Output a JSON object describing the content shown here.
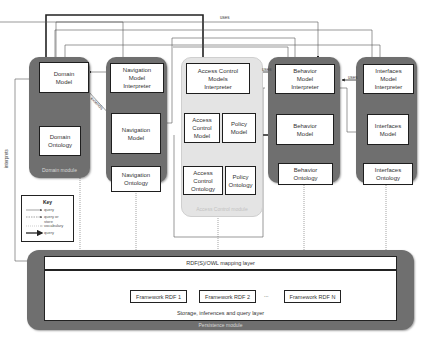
{
  "modules": {
    "domain": {
      "label": "Domain module",
      "boxes": {
        "model": "Domain\nModel",
        "ontology": "Domain\nOntology"
      }
    },
    "navigation": {
      "label": "Navigation module",
      "boxes": {
        "interpreter": "Navigation\nModel\nInterpreter",
        "model": "Navigation\nModel",
        "ontology": "Navigation\nOntology"
      }
    },
    "access_control": {
      "label": "Access Control module",
      "boxes": {
        "interpreter": "Access Control\nModels\nInterpreter",
        "ac_model": "Access\nControl\nModel",
        "policy_model": "Policy\nModel",
        "ac_ontology": "Access\nControl\nOntology",
        "policy_ontology": "Policy\nOntology"
      }
    },
    "behavior": {
      "label": "Behavior module",
      "boxes": {
        "interpreter": "Behavior\nModel\nInterpreter",
        "model": "Behavior\nModel",
        "ontology": "Behavior\nOntology"
      }
    },
    "interfaces": {
      "label": "Interface module",
      "boxes": {
        "interpreter": "Interfaces\nModel\nInterpreter",
        "model": "Interfaces\nModel",
        "ontology": "Interfaces\nOntology"
      }
    },
    "persistence": {
      "label": "Persistence module",
      "mapping_layer": "RDF(S)/OWL mapping layer",
      "storage_layer": "Storage, inferences and query layer",
      "frameworks": [
        "Framework RDF 1",
        "Framework RDF 2",
        "...",
        "Framework RDF N"
      ]
    }
  },
  "edge_labels": {
    "uses_top": "uses",
    "uses_behavior": "uses",
    "uses_interfaces": "uses",
    "extends": "extends",
    "interprets": "interprets"
  },
  "key": {
    "title": "Key",
    "items": [
      {
        "style": "thin-solid-arrow",
        "label": "query"
      },
      {
        "style": "dashed-arrow",
        "label": "query or\nstore"
      },
      {
        "style": "dotted-open-arrow",
        "label": "vocabulary"
      },
      {
        "style": "thick-solid-arrow",
        "label": "query"
      }
    ]
  },
  "colors": {
    "module_dark": "#6f6f6f",
    "module_light": "#e4e4e4",
    "box_border": "#1e1e1e",
    "line": "#333333"
  }
}
